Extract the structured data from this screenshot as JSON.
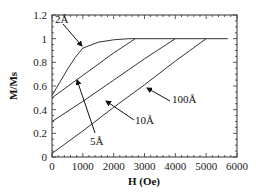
{
  "chart_data": {
    "type": "line",
    "title": "",
    "xlabel": "H  (Oe)",
    "ylabel": "M/Ms",
    "xlim": [
      0,
      6000
    ],
    "ylim": [
      0,
      1.2
    ],
    "grid": false,
    "legend": "none (inline annotations with arrows)",
    "x_ticks": [
      "0",
      "1000",
      "2000",
      "3000",
      "4000",
      "5000",
      "6000"
    ],
    "y_ticks": [
      "0",
      "0.2",
      "0.4",
      "0.6",
      "0.8",
      "1",
      "1.2"
    ],
    "series": [
      {
        "name": "2Å",
        "points": [
          [
            0,
            0.52
          ],
          [
            250,
            0.63
          ],
          [
            500,
            0.74
          ],
          [
            750,
            0.84
          ],
          [
            1000,
            0.92
          ],
          [
            1500,
            0.97
          ],
          [
            2000,
            0.99
          ],
          [
            2500,
            1.0
          ],
          [
            5700,
            1.0
          ]
        ]
      },
      {
        "name": "5Å",
        "points": [
          [
            0,
            0.5
          ],
          [
            1000,
            0.69
          ],
          [
            2000,
            0.88
          ],
          [
            2700,
            1.0
          ]
        ]
      },
      {
        "name": "10Å",
        "points": [
          [
            0,
            0.3
          ],
          [
            1000,
            0.47
          ],
          [
            2000,
            0.65
          ],
          [
            3000,
            0.83
          ],
          [
            4000,
            1.0
          ]
        ]
      },
      {
        "name": "100Å",
        "points": [
          [
            0,
            0.03
          ],
          [
            1000,
            0.22
          ],
          [
            2000,
            0.42
          ],
          [
            3000,
            0.61
          ],
          [
            4000,
            0.81
          ],
          [
            5000,
            1.0
          ]
        ]
      }
    ],
    "annotations": [
      {
        "text": "2Å",
        "arrow_to": [
          1000,
          0.92
        ]
      },
      {
        "text": "5Å",
        "arrow_to": [
          800,
          0.65
        ]
      },
      {
        "text": "10Å",
        "arrow_to": [
          2100,
          0.66
        ]
      },
      {
        "text": "100Å",
        "arrow_to": [
          3800,
          0.78
        ]
      }
    ]
  },
  "labels": {
    "x_axis": "H  (Oe)",
    "y_axis": "M/Ms",
    "anno_2": "2Å",
    "anno_5": "5Å",
    "anno_10": "10Å",
    "anno_100": "100Å"
  }
}
